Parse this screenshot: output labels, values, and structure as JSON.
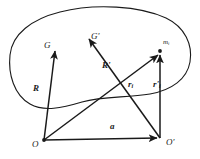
{
  "figure": {
    "name": "rigid-body-position-vectors-diagram",
    "background_color": "#ffffff",
    "stroke_color": "#1a1a1a",
    "body_outline": {
      "name": "rigid-body-blob",
      "description": "closed irregular blob outline representing a rigid body"
    }
  },
  "points": {
    "G": {
      "label": "G",
      "x": 55,
      "y": 48
    },
    "Gp": {
      "label": "G'",
      "x": 88,
      "y": 36
    },
    "mi": {
      "label": "m",
      "sub": "i",
      "x": 160,
      "y": 52
    },
    "O": {
      "label": "O",
      "x": 44,
      "y": 140
    },
    "Op": {
      "label": "O'",
      "x": 160,
      "y": 138
    }
  },
  "vectors": [
    {
      "name": "R",
      "label": "R",
      "prime": "",
      "sub": "",
      "from": "O",
      "to": "G"
    },
    {
      "name": "Rprime",
      "label": "R",
      "prime": "'",
      "sub": "",
      "from": "Op",
      "to": "Gp"
    },
    {
      "name": "ri",
      "label": "r",
      "prime": "",
      "sub": "i",
      "from": "O",
      "to": "mi"
    },
    {
      "name": "riprime",
      "label": "r",
      "prime": "'",
      "sub": "i",
      "from": "Op",
      "to": "mi"
    },
    {
      "name": "a",
      "label": "a",
      "prime": "",
      "sub": "",
      "from": "O",
      "to": "Op"
    }
  ],
  "labels": {
    "G": {
      "text": "G",
      "x": 44,
      "y": 41
    },
    "Gprime": {
      "text": "G'",
      "x": 91,
      "y": 34
    },
    "mi": {
      "text": "m",
      "sub": "i",
      "x": 163,
      "y": 41
    },
    "O": {
      "text": "O",
      "x": 33,
      "y": 142
    },
    "Oprime": {
      "text": "O'",
      "x": 166,
      "y": 140
    },
    "R": {
      "text": "R",
      "x": 34,
      "y": 86
    },
    "Rprime": {
      "text": "R'",
      "x": 103,
      "y": 64
    },
    "ri": {
      "text": "r",
      "sub": "i",
      "x": 128,
      "y": 82
    },
    "riprime": {
      "text": "r'",
      "sub": "i",
      "x": 154,
      "y": 82
    },
    "a": {
      "text": "a",
      "x": 110,
      "y": 124
    }
  }
}
